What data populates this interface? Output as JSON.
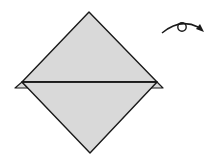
{
  "diagram": {
    "type": "origami-step",
    "colors": {
      "paper": "#d9d9d9",
      "stroke": "#1a1a1a",
      "background": "#ffffff"
    },
    "shapes": {
      "upper_triangle": "89,12 22,82 157,82",
      "lower_triangle": "22,82 157,82 90,153",
      "left_flap": "22,82 15,88 28,88",
      "right_flap": "157,82 150,88 163,88",
      "fold_line": {
        "x1": 22,
        "y1": 82,
        "x2": 157,
        "y2": 82
      }
    },
    "symbols": [
      {
        "name": "turn-over",
        "meaning": "Turn the model over"
      }
    ]
  }
}
